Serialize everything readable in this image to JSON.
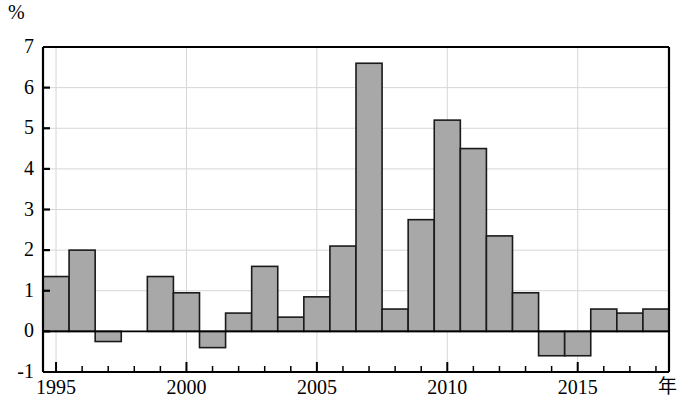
{
  "chart_data": {
    "type": "bar",
    "title": "",
    "subtitle": "",
    "ylabel": "%",
    "xlabel": "年",
    "ylim": [
      -1,
      7
    ],
    "xlim": [
      1994.5,
      2018.5
    ],
    "y_ticks": [
      -1,
      0,
      1,
      2,
      3,
      4,
      5,
      6,
      7
    ],
    "y_tick_labels": [
      "-1",
      "0",
      "1",
      "2",
      "3",
      "4",
      "5",
      "6",
      "7"
    ],
    "x_ticks": [
      1995,
      1996,
      1997,
      1998,
      1999,
      2000,
      2001,
      2002,
      2003,
      2004,
      2005,
      2006,
      2007,
      2008,
      2009,
      2010,
      2011,
      2012,
      2013,
      2014,
      2015,
      2016,
      2017,
      2018
    ],
    "x_tick_labels_shown": [
      "1995",
      "2000",
      "2005",
      "2010",
      "2015"
    ],
    "x_labeled_ticks": [
      1995,
      2000,
      2005,
      2010,
      2015
    ],
    "grid": true,
    "grid_axis": "both",
    "legend": "none",
    "bar_fill": "#a8a8a8",
    "bar_edge": "#1a1a1a",
    "axis_color": "#000000",
    "grid_color": "#d6d6d6",
    "categories": [
      "1995",
      "1996",
      "1997",
      "1998",
      "1999",
      "2000",
      "2001",
      "2002",
      "2003",
      "2004",
      "2005",
      "2006",
      "2007",
      "2008",
      "2009",
      "2010",
      "2011",
      "2012",
      "2013",
      "2014",
      "2015",
      "2016",
      "2017",
      "2018"
    ],
    "values": [
      1.35,
      2.0,
      -0.25,
      0.0,
      1.35,
      0.95,
      -0.4,
      0.45,
      1.6,
      0.35,
      0.85,
      2.1,
      6.6,
      0.55,
      2.75,
      5.2,
      4.5,
      2.35,
      0.95,
      -0.6,
      -0.6,
      0.55,
      0.45,
      0.55
    ]
  }
}
